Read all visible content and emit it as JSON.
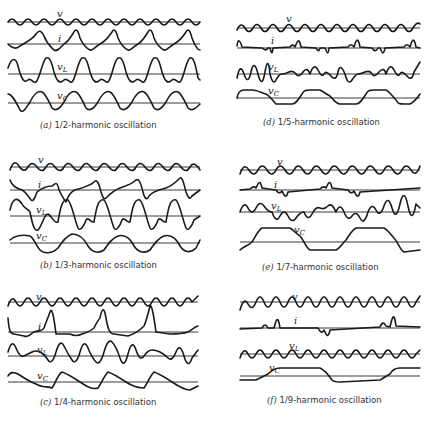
{
  "figure": {
    "panels": [
      {
        "id": "a",
        "letter": "(a)",
        "caption": "1/2-harmonic oscillation",
        "subharmonic_order": 2,
        "box": {
          "x": 8,
          "y": 12,
          "w": 192,
          "h": 125
        },
        "trace_labels": {
          "v": "v",
          "i": "i",
          "vL": "v",
          "vL_sub": "L",
          "vC": "v",
          "vC_sub": "C"
        }
      },
      {
        "id": "d",
        "letter": "(d)",
        "caption": "1/5-harmonic oscillation",
        "subharmonic_order": 5,
        "box": {
          "x": 237,
          "y": 12,
          "w": 183,
          "h": 125
        },
        "trace_labels": {
          "v": "v",
          "i": "i",
          "vL": "v",
          "vL_sub": "L",
          "vC": "v",
          "vC_sub": "C"
        }
      },
      {
        "id": "b",
        "letter": "(b)",
        "caption": "1/3-harmonic oscillation",
        "subharmonic_order": 3,
        "box": {
          "x": 8,
          "y": 155,
          "w": 192,
          "h": 125
        },
        "trace_labels": {
          "v": "v",
          "i": "i",
          "vL": "v",
          "vL_sub": "L",
          "vC": "v",
          "vC_sub": "C"
        }
      },
      {
        "id": "e",
        "letter": "(e)",
        "caption": "1/7-harmonic oscillation",
        "subharmonic_order": 7,
        "box": {
          "x": 237,
          "y": 155,
          "w": 183,
          "h": 125
        },
        "trace_labels": {
          "v": "v",
          "i": "i",
          "vL": "v",
          "vL_sub": "L",
          "vC": "v",
          "vC_sub": "C"
        }
      },
      {
        "id": "c",
        "letter": "(c)",
        "caption": "1/4-harmonic oscillation",
        "subharmonic_order": 4,
        "box": {
          "x": 8,
          "y": 292,
          "w": 192,
          "h": 125
        },
        "trace_labels": {
          "v": "v",
          "i": "i",
          "vL": "v",
          "vL_sub": "L",
          "vC": "v",
          "vC_sub": "C"
        }
      },
      {
        "id": "f",
        "letter": "(f)",
        "caption": "1/9-harmonic oscillation",
        "subharmonic_order": 9,
        "box": {
          "x": 237,
          "y": 292,
          "w": 183,
          "h": 125
        },
        "trace_labels": {
          "v": "v",
          "i": "i",
          "vL": "v",
          "vL_sub": "L",
          "vC": "v",
          "vC_sub": "C"
        }
      }
    ],
    "trace_names": [
      "v",
      "i",
      "v_L",
      "v_C"
    ],
    "colors": {
      "ink": "#1a1a1a",
      "background": "#ffffff",
      "caption": "#333333"
    }
  }
}
